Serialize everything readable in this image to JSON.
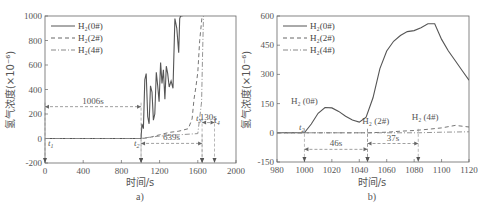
{
  "chart_data": [
    {
      "id": "a",
      "type": "line",
      "caption": "a)",
      "title": "",
      "xlabel": "时间/s",
      "ylabel": "氢气浓度(×10⁻⁶)",
      "xlim": [
        0,
        2000
      ],
      "ylim": [
        -200,
        1000
      ],
      "xticks": [
        "0",
        "400",
        "800",
        "1200",
        "1600",
        "2000"
      ],
      "yticks": [
        "-200",
        "0",
        "200",
        "400",
        "600",
        "800",
        "1000"
      ],
      "grid": false,
      "legend_position": "upper-left",
      "legend": [
        "H₂(0#)",
        "H₂(2#)",
        "H₂(4#)"
      ],
      "series": [
        {
          "name": "H₂(0#)",
          "style": "solid",
          "x": [
            0,
            1006,
            1015,
            1030,
            1045,
            1060,
            1075,
            1090,
            1105,
            1120,
            1135,
            1150,
            1165,
            1180,
            1195,
            1210,
            1225,
            1240,
            1255,
            1270,
            1285,
            1300,
            1320,
            1340,
            1360,
            1380,
            1400,
            1410,
            1420,
            1430,
            1440
          ],
          "y": [
            0,
            0,
            120,
            80,
            480,
            530,
            180,
            120,
            430,
            380,
            150,
            200,
            540,
            430,
            300,
            620,
            450,
            560,
            320,
            590,
            530,
            420,
            470,
            410,
            980,
            900,
            700,
            980,
            1000,
            1000,
            1000
          ]
        },
        {
          "name": "H₂(2#)",
          "style": "dashed",
          "x": [
            0,
            1000,
            1052,
            1100,
            1200,
            1300,
            1400,
            1500,
            1540,
            1560,
            1580,
            1600,
            1620,
            1645
          ],
          "y": [
            0,
            0,
            3,
            10,
            30,
            50,
            60,
            80,
            160,
            320,
            420,
            540,
            800,
            1000
          ]
        },
        {
          "name": "H₂(4#)",
          "style": "dash-dot",
          "x": [
            0,
            1000,
            1089,
            1200,
            1400,
            1600,
            1640,
            1650,
            1660
          ],
          "y": [
            0,
            0,
            10,
            20,
            30,
            40,
            300,
            700,
            1000
          ]
        }
      ],
      "annotations": [
        {
          "text": "1006s",
          "from_x": 0,
          "to_x": 1006,
          "y": 260
        },
        {
          "text": "639s",
          "from_x": 1006,
          "to_x": 1645,
          "y": -40
        },
        {
          "text": "130s",
          "from_x": 1645,
          "to_x": 1775,
          "y": 130
        },
        {
          "text": "t1",
          "x": 60,
          "y": -60
        },
        {
          "text": "t2",
          "x": 960,
          "y": -60
        },
        {
          "text": "t3",
          "x": 1610,
          "y": 140
        },
        {
          "text": "t4",
          "x": 1800,
          "y": 130
        }
      ]
    },
    {
      "id": "b",
      "type": "line",
      "caption": "b)",
      "title": "",
      "xlabel": "时间/s",
      "ylabel": "氢气浓度(×10⁻⁶)",
      "xlim": [
        980,
        1120
      ],
      "ylim": [
        -150,
        600
      ],
      "xticks": [
        "980",
        "1000",
        "1020",
        "1040",
        "1060",
        "1080",
        "1100",
        "1120"
      ],
      "yticks": [
        "-150",
        "0",
        "150",
        "300",
        "450",
        "600"
      ],
      "grid": false,
      "legend_position": "upper-left",
      "legend": [
        "H₂(0#)",
        "H₂(2#)",
        "H₂(4#)"
      ],
      "series": [
        {
          "name": "H₂(0#)",
          "style": "solid",
          "x": [
            980,
            1000,
            1005,
            1010,
            1015,
            1020,
            1025,
            1030,
            1035,
            1040,
            1045,
            1050,
            1055,
            1060,
            1065,
            1070,
            1075,
            1080,
            1085,
            1090,
            1095,
            1100,
            1105,
            1110,
            1115,
            1120
          ],
          "y": [
            0,
            0,
            45,
            100,
            130,
            128,
            110,
            85,
            65,
            55,
            80,
            180,
            330,
            420,
            470,
            500,
            520,
            525,
            540,
            560,
            560,
            480,
            420,
            370,
            320,
            270
          ]
        },
        {
          "name": "H₂(2#)",
          "style": "dashed",
          "x": [
            980,
            1046,
            1060,
            1070,
            1080,
            1090,
            1100,
            1110,
            1120
          ],
          "y": [
            0,
            0,
            3,
            8,
            12,
            18,
            25,
            38,
            30
          ]
        },
        {
          "name": "H₂(4#)",
          "style": "dash-dot",
          "x": [
            980,
            1083,
            1100,
            1120
          ],
          "y": [
            0,
            0,
            3,
            5
          ]
        }
      ],
      "annotations": [
        {
          "text": "H₂ (0#)",
          "x": 1000,
          "y": 150
        },
        {
          "text": "H₂ (2#)",
          "x": 1052,
          "y": 45
        },
        {
          "text": "H₂ (4#)",
          "x": 1088,
          "y": 65
        },
        {
          "text": "t2",
          "x": 998,
          "y": 15
        },
        {
          "text": "46s",
          "from_x": 1000,
          "to_x": 1046,
          "y": -85
        },
        {
          "text": "37s",
          "from_x": 1046,
          "to_x": 1083,
          "y": -55
        }
      ]
    }
  ]
}
